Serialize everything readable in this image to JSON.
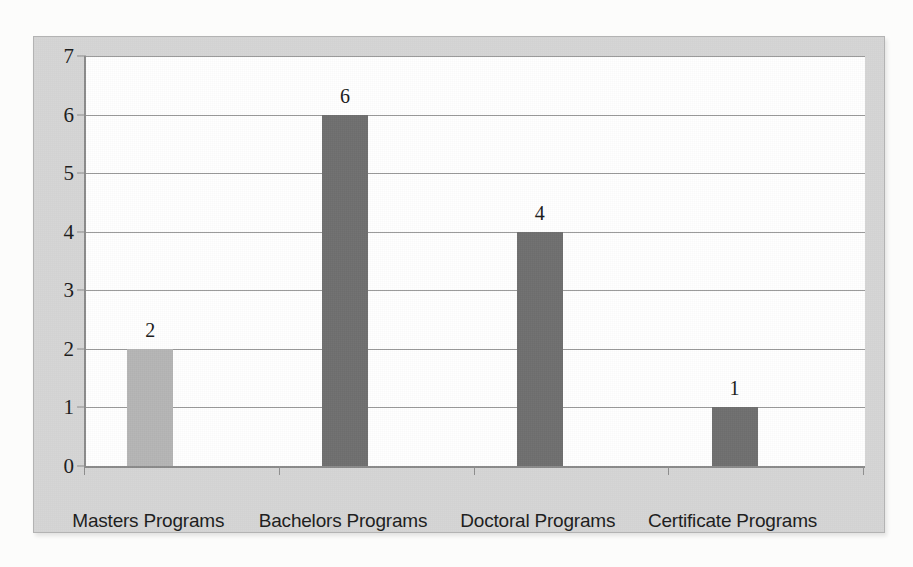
{
  "chart_data": {
    "type": "bar",
    "title": "",
    "subtitle": "",
    "xlabel": "",
    "ylabel": "",
    "categories": [
      "Masters Programs",
      "Bachelors Programs",
      "Doctoral Programs",
      "Certificate Programs"
    ],
    "values": [
      2,
      6,
      4,
      1
    ],
    "value_labels": [
      "2",
      "6",
      "4",
      "1"
    ],
    "series": [
      {
        "name": "",
        "values": [
          2,
          6,
          4,
          1
        ]
      }
    ],
    "ylim": [
      0,
      7
    ],
    "ytick_labels": [
      "0",
      "1",
      "2",
      "3",
      "4",
      "5",
      "6",
      "7"
    ],
    "ytick_values": [
      0,
      1,
      2,
      3,
      4,
      5,
      6,
      7
    ],
    "grid": "horizontal",
    "legend": "none",
    "bar_colors": [
      "#b5b5b5",
      "#6f6f6f",
      "#6f6f6f",
      "#6f6f6f"
    ],
    "annotations": []
  },
  "style": {
    "panel_background": "#d6d6d6",
    "panel_border": "#b3b3b3",
    "plot_background": "#ffffff",
    "gridline_color": "#9a9a9a",
    "axis_color": "#8c8c8c",
    "text_color": "#1c1c1c",
    "page_background": "#fcfcfb"
  }
}
